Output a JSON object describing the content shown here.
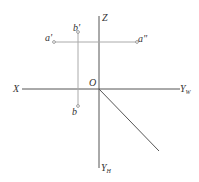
{
  "diagram": {
    "type": "orthographic-projection-axes",
    "axes": {
      "x_label": "X",
      "z_label": "Z",
      "origin_label": "O",
      "yw_label": "Y",
      "yw_sub": "W",
      "yh_label": "Y",
      "yh_sub": "H"
    },
    "points": {
      "a_front": "a'",
      "a_side": "a\"",
      "b_front": "b'",
      "b_top": "b"
    },
    "colors": {
      "axis": "#555555",
      "projection_line": "#aaaaaa",
      "text": "#333333"
    }
  }
}
